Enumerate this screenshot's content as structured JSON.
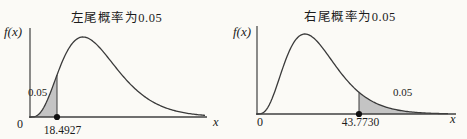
{
  "figure": {
    "background": "#fbfaf6",
    "text_color": "#1c1c1c",
    "curve_color": "#3a3a3a",
    "axis_color": "#404040",
    "shade_color": "#c4c4c4",
    "dot_color": "#111111"
  },
  "chart_data": [
    {
      "type": "area",
      "title": "左尾概率为0.05",
      "subtitle": "",
      "curve": "chi-square-like probability density (schematic)",
      "ylabel": "f(x)",
      "xlabel": "x",
      "origin_label": "0",
      "tail": "left",
      "tail_probability": 0.05,
      "tail_label": "0.05",
      "critical_value": 18.4927,
      "critical_value_label": "18.4927",
      "x_ticks": [
        "0",
        "18.4927"
      ],
      "grid": false,
      "legend": false
    },
    {
      "type": "area",
      "title": "右尾概率为0.05",
      "subtitle": "",
      "curve": "chi-square-like probability density (schematic)",
      "ylabel": "f(x)",
      "xlabel": "x",
      "origin_label": "0",
      "tail": "right",
      "tail_probability": 0.05,
      "tail_label": "0.05",
      "critical_value": 43.773,
      "critical_value_label": "43.7730",
      "x_ticks": [
        "0",
        "43.7730"
      ],
      "grid": false,
      "legend": false
    }
  ]
}
